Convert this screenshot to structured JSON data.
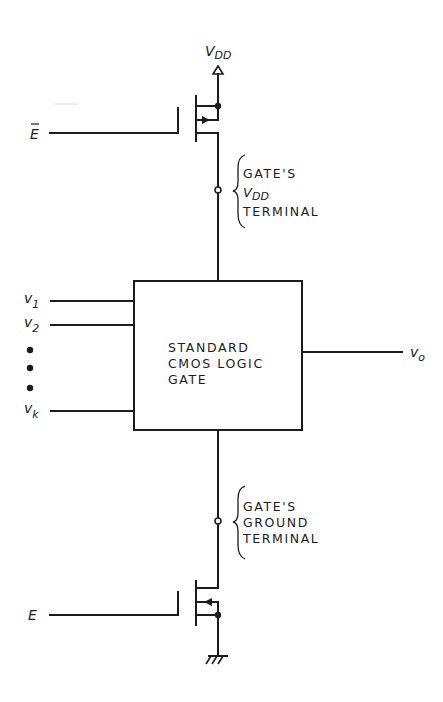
{
  "diagram": {
    "type": "circuit-schematic",
    "supply": {
      "label_main": "V",
      "label_sub": "DD"
    },
    "ground_symbol": "ground-icon",
    "enable_inputs": {
      "pmos_gate_label": "E",
      "pmos_gate_overbar": true,
      "nmos_gate_label": "E"
    },
    "upper_annotation": {
      "line1": "GATE'S",
      "line2_main": "V",
      "line2_sub": "DD",
      "line3": "TERMINAL"
    },
    "lower_annotation": {
      "line1": "GATE'S",
      "line2": "GROUND",
      "line3": "TERMINAL"
    },
    "logic_block": {
      "line1": "STANDARD",
      "line2": "CMOS LOGIC",
      "line3": "GATE"
    },
    "inputs": [
      {
        "main": "v",
        "sub": "1"
      },
      {
        "main": "v",
        "sub": "2"
      },
      {
        "main": "v",
        "sub": "k"
      }
    ],
    "ellipsis_dots": 3,
    "output": {
      "main": "v",
      "sub": "o"
    },
    "colors": {
      "ink": "#1c1c1c",
      "background": "#ffffff"
    }
  }
}
